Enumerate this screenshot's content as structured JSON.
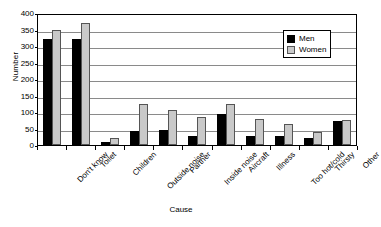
{
  "chart_data": {
    "type": "bar",
    "title": "",
    "xlabel": "Cause",
    "ylabel": "Number",
    "ylim": [
      0,
      400
    ],
    "y_ticks": [
      0,
      50,
      100,
      150,
      200,
      250,
      300,
      350,
      400
    ],
    "grid": true,
    "legend_position": "top-right",
    "categories": [
      "Don't know",
      "Toilet",
      "Children",
      "Outside noise",
      "Partner",
      "Inside noise",
      "Aircraft",
      "Illness",
      "Too hot/cold",
      "Thirsty",
      "Other"
    ],
    "series": [
      {
        "name": "Men",
        "color": "#000000",
        "values": [
          320,
          320,
          8,
          43,
          46,
          28,
          93,
          28,
          26,
          20,
          72
        ]
      },
      {
        "name": "Women",
        "color": "#c9c9c9",
        "values": [
          348,
          370,
          22,
          124,
          105,
          85,
          123,
          78,
          63,
          38,
          75
        ]
      }
    ]
  },
  "legend": {
    "entries": [
      {
        "label": "Men"
      },
      {
        "label": "Women"
      }
    ]
  }
}
